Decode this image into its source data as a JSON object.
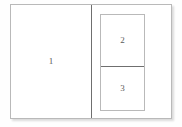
{
  "document": {
    "title": "Layout Regions",
    "background_color": "#fefefe",
    "frame": {
      "border_color": "#b9b9b9",
      "fill_color": "#ffffff",
      "divider_color": "#6f6f6f"
    }
  },
  "regions": [
    {
      "id": "region-1",
      "label": "1",
      "position": "left",
      "description": "large left region"
    },
    {
      "id": "region-2",
      "label": "2",
      "position": "right-top",
      "description": "upper nested region"
    },
    {
      "id": "region-3",
      "label": "3",
      "position": "right-bottom",
      "description": "lower nested region"
    }
  ]
}
